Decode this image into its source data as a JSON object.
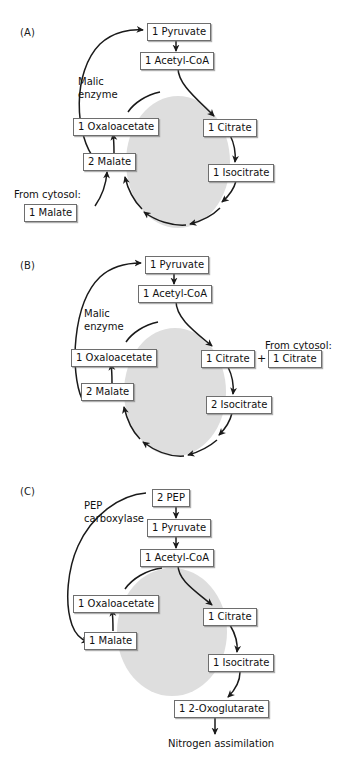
{
  "panels": [
    {
      "id": "A",
      "label": "(A)",
      "enzyme_label": "Malic\nenzyme",
      "cytosol_label": "From cytosol:",
      "nodes": {
        "pyruvate": "1 Pyruvate",
        "acetyl_coa": "1 Acetyl-CoA",
        "citrate": "1 Citrate",
        "isocitrate": "1 Isocitrate",
        "oxaloacetate": "1 Oxaloacetate",
        "malate": "2 Malate",
        "cytosol_malate": "1 Malate"
      }
    },
    {
      "id": "B",
      "label": "(B)",
      "enzyme_label": "Malic\nenzyme",
      "cytosol_label": "From cytosol:",
      "plus": "+",
      "nodes": {
        "pyruvate": "1 Pyruvate",
        "acetyl_coa": "1 Acetyl-CoA",
        "citrate": "1 Citrate",
        "cytosol_citrate": "1 Citrate",
        "isocitrate": "2 Isocitrate",
        "oxaloacetate": "1 Oxaloacetate",
        "malate": "2 Malate"
      }
    },
    {
      "id": "C",
      "label": "(C)",
      "enzyme_label": "PEP\ncarboxylase",
      "output_label": "Nitrogen assimilation",
      "nodes": {
        "pep": "2 PEP",
        "pyruvate": "1 Pyruvate",
        "acetyl_coa": "1 Acetyl-CoA",
        "citrate": "1 Citrate",
        "isocitrate": "1 Isocitrate",
        "oxoglutarate": "1 2-Oxoglutarate",
        "oxaloacetate": "1 Oxaloacetate",
        "malate": "1 Malate"
      }
    }
  ],
  "colors": {
    "cycle_fill": "#dedede",
    "box_border": "#6e6e6e",
    "text": "#111111",
    "arrow": "#1a1a1a",
    "background": "#ffffff"
  }
}
